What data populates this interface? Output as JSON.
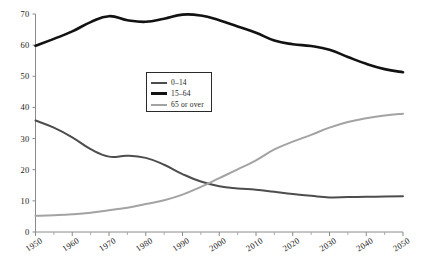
{
  "chart_data": {
    "type": "line",
    "title": "",
    "subtitle": "",
    "xlabel": "",
    "ylabel": "",
    "xlim": [
      1950,
      2050
    ],
    "ylim": [
      0,
      70
    ],
    "grid": false,
    "legend_position": "inside-center-left",
    "x_tick_labels": [
      "1950",
      "1960",
      "1970",
      "1980",
      "1990",
      "2000",
      "2010",
      "2020",
      "2030",
      "2040",
      "2050"
    ],
    "x_tick_values": [
      1950,
      1960,
      1970,
      1980,
      1990,
      2000,
      2010,
      2020,
      2030,
      2040,
      2050
    ],
    "x_minor_tick_values": [
      1955,
      1965,
      1975,
      1985,
      1995,
      2005,
      2015,
      2025,
      2035,
      2045
    ],
    "y_tick_labels": [
      "0",
      "10",
      "20",
      "30",
      "40",
      "50",
      "60",
      "70"
    ],
    "y_tick_values": [
      0,
      10,
      20,
      30,
      40,
      50,
      60,
      70
    ],
    "x": [
      1950,
      1955,
      1960,
      1965,
      1970,
      1975,
      1980,
      1985,
      1990,
      1995,
      2000,
      2005,
      2010,
      2015,
      2020,
      2025,
      2030,
      2035,
      2040,
      2045,
      2050
    ],
    "series": [
      {
        "name": "0–14",
        "color": "#4d4d4d",
        "width": 2.0,
        "values": [
          35.8,
          33.5,
          30.4,
          26.6,
          24.2,
          24.5,
          23.8,
          21.6,
          18.6,
          16.2,
          14.7,
          14.0,
          13.6,
          12.9,
          12.2,
          11.6,
          11.1,
          11.2,
          11.3,
          11.4,
          11.5
        ]
      },
      {
        "name": "15–64",
        "color": "#121212",
        "width": 2.6,
        "values": [
          59.8,
          62.0,
          64.4,
          67.4,
          69.3,
          68.0,
          67.5,
          68.5,
          69.8,
          69.5,
          68.0,
          66.0,
          64.0,
          61.5,
          60.3,
          59.7,
          58.5,
          56.2,
          54.0,
          52.3,
          51.3
        ]
      },
      {
        "name": "65 or over",
        "color": "#a3a3a3",
        "width": 2.0,
        "values": [
          5.2,
          5.4,
          5.7,
          6.2,
          7.0,
          7.8,
          9.0,
          10.2,
          12.0,
          14.5,
          17.3,
          20.1,
          23.0,
          26.5,
          29.0,
          31.2,
          33.5,
          35.3,
          36.5,
          37.4,
          38.0
        ]
      }
    ],
    "annotations": []
  },
  "legend": {
    "items": [
      {
        "label": "0–14"
      },
      {
        "label": "15–64"
      },
      {
        "label": "65 or over"
      }
    ]
  }
}
